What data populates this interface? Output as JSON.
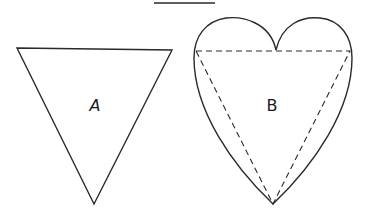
{
  "diagram": {
    "top_line": {
      "x1": 154,
      "y1": 3,
      "x2": 215,
      "y2": 3
    },
    "shape_a": {
      "label": "A",
      "type": "inverted-triangle",
      "points": [
        [
          17,
          48
        ],
        [
          172,
          50
        ],
        [
          94,
          204
        ]
      ],
      "label_pos": [
        95,
        110
      ]
    },
    "shape_b": {
      "label": "B",
      "type": "heart",
      "inscribed_triangle": [
        [
          196,
          51
        ],
        [
          350,
          51
        ],
        [
          273,
          204
        ]
      ],
      "dip": [
        276,
        50
      ],
      "bottom": [
        273,
        204
      ],
      "label_pos": [
        272,
        110
      ]
    },
    "colors": {
      "stroke": "#2a2a2a",
      "background": "#ffffff"
    }
  }
}
